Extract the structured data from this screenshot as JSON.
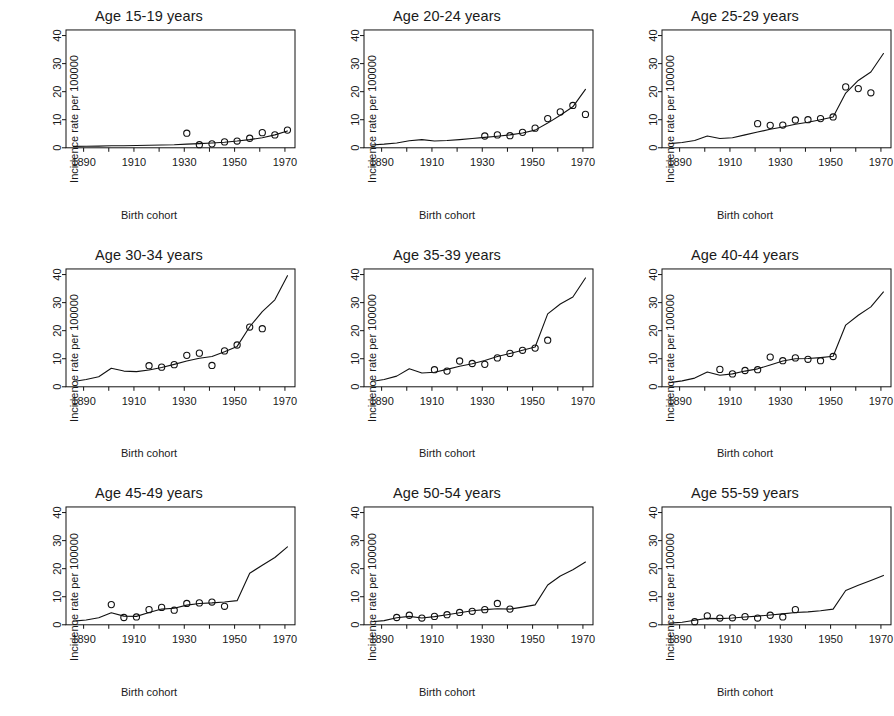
{
  "figure": {
    "axis_title_y": "Incidence rate per 100000",
    "axis_title_x": "Birth cohort",
    "y_ticks": [
      0,
      10,
      20,
      30,
      40
    ],
    "x_ticks_major": [
      1890,
      1910,
      1930,
      1950,
      1970
    ],
    "x_ticks_minor": [
      1900,
      1920,
      1940,
      1960
    ],
    "x_range": [
      1883,
      1974
    ],
    "y_range": [
      0,
      42
    ],
    "line_color": "#111111",
    "point_color": "#111111",
    "background": "#ffffff",
    "panel_count": 9,
    "grid": "none"
  },
  "chart_data": [
    {
      "type": "line",
      "title": "Age 15-19 years",
      "xlabel": "Birth cohort",
      "ylabel": "Incidence rate per 100000",
      "xlim": [
        1883,
        1974
      ],
      "ylim": [
        0,
        42
      ],
      "series": [
        {
          "name": "fitted",
          "x": [
            1886,
            1891,
            1896,
            1901,
            1906,
            1911,
            1916,
            1921,
            1926,
            1931,
            1936,
            1941,
            1946,
            1951,
            1956,
            1961,
            1966,
            1971
          ],
          "values": [
            0.5,
            0.55,
            0.6,
            0.7,
            0.75,
            0.8,
            0.9,
            1.0,
            1.1,
            1.3,
            1.5,
            1.7,
            2.0,
            2.4,
            2.9,
            3.6,
            4.6,
            6.0
          ]
        }
      ],
      "points": {
        "name": "observed",
        "x": [
          1931,
          1936,
          1941,
          1946,
          1951,
          1956,
          1961,
          1966,
          1971
        ],
        "values": [
          5.2,
          1.1,
          1.4,
          2.1,
          2.4,
          3.4,
          5.4,
          4.6,
          6.3
        ]
      }
    },
    {
      "type": "line",
      "title": "Age 20-24 years",
      "xlabel": "Birth cohort",
      "ylabel": "Incidence rate per 100000",
      "xlim": [
        1883,
        1974
      ],
      "ylim": [
        0,
        42
      ],
      "series": [
        {
          "name": "fitted",
          "x": [
            1886,
            1891,
            1896,
            1901,
            1906,
            1911,
            1916,
            1921,
            1926,
            1931,
            1936,
            1941,
            1946,
            1951,
            1956,
            1961,
            1966,
            1971
          ],
          "values": [
            1.0,
            1.3,
            1.7,
            2.5,
            2.9,
            2.4,
            2.6,
            2.9,
            3.3,
            3.7,
            4.1,
            4.6,
            5.3,
            6.3,
            8.8,
            11.6,
            14.6,
            20.8
          ]
        }
      ],
      "points": {
        "name": "observed",
        "x": [
          1931,
          1936,
          1941,
          1946,
          1951,
          1956,
          1961,
          1966,
          1971
        ],
        "values": [
          4.2,
          4.6,
          4.3,
          5.5,
          7.0,
          10.4,
          12.8,
          15.1,
          11.9
        ]
      }
    },
    {
      "type": "line",
      "title": "Age 25-29 years",
      "xlabel": "Birth cohort",
      "ylabel": "Incidence rate per 100000",
      "xlim": [
        1883,
        1974
      ],
      "ylim": [
        0,
        42
      ],
      "series": [
        {
          "name": "fitted",
          "x": [
            1886,
            1891,
            1896,
            1901,
            1906,
            1911,
            1916,
            1921,
            1926,
            1931,
            1936,
            1941,
            1946,
            1951,
            1956,
            1961,
            1966,
            1971
          ],
          "values": [
            1.5,
            1.9,
            2.6,
            4.2,
            3.3,
            3.6,
            4.6,
            5.6,
            6.6,
            7.4,
            8.4,
            9.1,
            10.0,
            11.0,
            19.5,
            24.0,
            27.0,
            33.6
          ]
        }
      ],
      "points": {
        "name": "observed",
        "x": [
          1921,
          1926,
          1931,
          1936,
          1941,
          1946,
          1951,
          1956,
          1961,
          1966
        ],
        "values": [
          8.6,
          8.0,
          8.1,
          9.9,
          10.0,
          10.4,
          11.0,
          21.7,
          21.1,
          19.6
        ]
      }
    },
    {
      "type": "line",
      "title": "Age 30-34 years",
      "xlabel": "Birth cohort",
      "ylabel": "Incidence rate per 100000",
      "xlim": [
        1883,
        1974
      ],
      "ylim": [
        0,
        42
      ],
      "series": [
        {
          "name": "fitted",
          "x": [
            1886,
            1891,
            1896,
            1901,
            1906,
            1911,
            1916,
            1921,
            1926,
            1931,
            1936,
            1941,
            1946,
            1951,
            1956,
            1961,
            1966,
            1971
          ],
          "values": [
            1.9,
            2.6,
            3.6,
            6.6,
            5.6,
            5.4,
            6.0,
            6.9,
            8.0,
            9.2,
            10.2,
            10.8,
            12.5,
            14.4,
            21.4,
            26.8,
            31.0,
            39.6
          ]
        }
      ],
      "points": {
        "name": "observed",
        "x": [
          1916,
          1921,
          1926,
          1931,
          1936,
          1941,
          1946,
          1951,
          1956,
          1961
        ],
        "values": [
          7.5,
          7.0,
          7.9,
          11.2,
          12.0,
          7.6,
          12.8,
          14.9,
          21.3,
          20.7
        ]
      }
    },
    {
      "type": "line",
      "title": "Age 35-39 years",
      "xlabel": "Birth cohort",
      "ylabel": "Incidence rate per 100000",
      "xlim": [
        1883,
        1974
      ],
      "ylim": [
        0,
        42
      ],
      "series": [
        {
          "name": "fitted",
          "x": [
            1886,
            1891,
            1896,
            1901,
            1906,
            1911,
            1916,
            1921,
            1926,
            1931,
            1936,
            1941,
            1946,
            1951,
            1956,
            1961,
            1966,
            1971
          ],
          "values": [
            1.9,
            2.6,
            3.8,
            6.4,
            4.9,
            5.2,
            6.2,
            7.3,
            8.2,
            9.4,
            10.8,
            11.9,
            13.0,
            14.2,
            26.0,
            29.5,
            32.0,
            38.8
          ]
        }
      ],
      "points": {
        "name": "observed",
        "x": [
          1911,
          1916,
          1921,
          1926,
          1931,
          1936,
          1941,
          1946,
          1951,
          1956
        ],
        "values": [
          6.1,
          5.6,
          9.2,
          8.3,
          8.0,
          10.3,
          11.9,
          13.0,
          13.8,
          16.6
        ]
      }
    },
    {
      "type": "line",
      "title": "Age 40-44 years",
      "xlabel": "Birth cohort",
      "ylabel": "Incidence rate per 100000",
      "xlim": [
        1883,
        1974
      ],
      "ylim": [
        0,
        42
      ],
      "series": [
        {
          "name": "fitted",
          "x": [
            1886,
            1891,
            1896,
            1901,
            1906,
            1911,
            1916,
            1921,
            1926,
            1931,
            1936,
            1941,
            1946,
            1951,
            1956,
            1961,
            1966,
            1971
          ],
          "values": [
            1.5,
            2.1,
            3.1,
            5.3,
            4.1,
            4.6,
            5.6,
            6.4,
            7.8,
            9.2,
            10.0,
            10.1,
            10.4,
            10.9,
            22.0,
            25.5,
            28.5,
            33.8
          ]
        }
      ],
      "points": {
        "name": "observed",
        "x": [
          1906,
          1911,
          1916,
          1921,
          1926,
          1931,
          1936,
          1941,
          1946,
          1951
        ],
        "values": [
          6.2,
          4.6,
          5.8,
          6.1,
          10.6,
          9.3,
          10.3,
          9.8,
          9.3,
          10.8
        ]
      }
    },
    {
      "type": "line",
      "title": "Age 45-49 years",
      "xlabel": "Birth cohort",
      "ylabel": "Incidence rate per 100000",
      "xlim": [
        1883,
        1974
      ],
      "ylim": [
        0,
        42
      ],
      "series": [
        {
          "name": "fitted",
          "x": [
            1886,
            1891,
            1896,
            1901,
            1906,
            1911,
            1916,
            1921,
            1926,
            1931,
            1936,
            1941,
            1946,
            1951,
            1956,
            1961,
            1966,
            1971
          ],
          "values": [
            1.3,
            1.7,
            2.5,
            4.3,
            3.1,
            3.0,
            4.4,
            5.6,
            5.9,
            7.0,
            7.6,
            7.8,
            8.1,
            8.6,
            18.4,
            21.2,
            24.0,
            27.8
          ]
        }
      ],
      "points": {
        "name": "observed",
        "x": [
          1901,
          1906,
          1911,
          1916,
          1921,
          1926,
          1931,
          1936,
          1941,
          1946
        ],
        "values": [
          7.2,
          2.6,
          2.8,
          5.4,
          6.2,
          5.2,
          7.6,
          7.8,
          8.1,
          6.6
        ]
      }
    },
    {
      "type": "line",
      "title": "Age 50-54 years",
      "xlabel": "Birth cohort",
      "ylabel": "Incidence rate per 100000",
      "xlim": [
        1883,
        1974
      ],
      "ylim": [
        0,
        42
      ],
      "series": [
        {
          "name": "fitted",
          "x": [
            1886,
            1891,
            1896,
            1901,
            1906,
            1911,
            1916,
            1921,
            1926,
            1931,
            1936,
            1941,
            1946,
            1951,
            1956,
            1961,
            1966,
            1971
          ],
          "values": [
            1.1,
            1.5,
            2.5,
            3.0,
            2.4,
            2.9,
            3.6,
            4.3,
            5.0,
            5.4,
            5.7,
            5.6,
            6.3,
            7.1,
            14.2,
            17.4,
            19.6,
            22.4
          ]
        }
      ],
      "points": {
        "name": "observed",
        "x": [
          1896,
          1901,
          1906,
          1911,
          1916,
          1921,
          1926,
          1931,
          1936,
          1941
        ],
        "values": [
          2.6,
          3.4,
          2.4,
          3.0,
          3.6,
          4.4,
          4.8,
          5.4,
          7.6,
          5.6
        ]
      }
    },
    {
      "type": "line",
      "title": "Age 55-59 years",
      "xlabel": "Birth cohort",
      "ylabel": "Incidence rate per 100000",
      "xlim": [
        1883,
        1974
      ],
      "ylim": [
        0,
        42
      ],
      "series": [
        {
          "name": "fitted",
          "x": [
            1886,
            1891,
            1896,
            1901,
            1906,
            1911,
            1916,
            1921,
            1926,
            1931,
            1936,
            1941,
            1946,
            1951,
            1956,
            1961,
            1966,
            1971
          ],
          "values": [
            0.6,
            0.9,
            1.6,
            2.3,
            2.2,
            2.4,
            2.8,
            3.1,
            3.5,
            3.9,
            4.4,
            4.6,
            5.0,
            5.6,
            12.2,
            14.1,
            15.8,
            17.6
          ]
        }
      ],
      "points": {
        "name": "observed",
        "x": [
          1896,
          1901,
          1906,
          1911,
          1916,
          1921,
          1926,
          1931,
          1936
        ],
        "values": [
          1.1,
          3.2,
          2.4,
          2.5,
          2.9,
          2.4,
          3.4,
          2.8,
          5.4
        ]
      }
    }
  ]
}
